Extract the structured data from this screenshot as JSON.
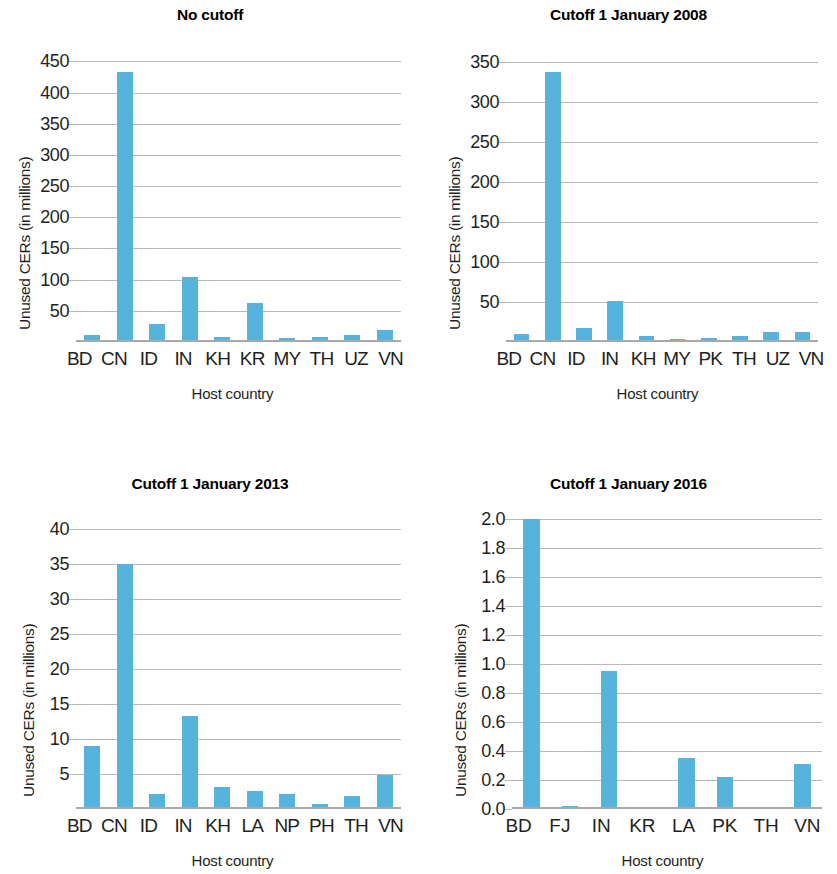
{
  "figure": {
    "panel_count": 4,
    "bar_color": "#55b3de",
    "grid_color": "#b9b9b9",
    "axis_color": "#a8a8a8",
    "text_color": "#231f20"
  },
  "chart_data": [
    {
      "type": "bar",
      "title": "No cutoff",
      "xlabel": "Host country",
      "ylabel": "Unused CERs (in millions)",
      "categories": [
        "BD",
        "CN",
        "ID",
        "IN",
        "KH",
        "KR",
        "MY",
        "TH",
        "UZ",
        "VN"
      ],
      "values": [
        11,
        433,
        29,
        105,
        8,
        63,
        7,
        8,
        12,
        19
      ],
      "yticks": [
        50,
        100,
        150,
        200,
        250,
        300,
        350,
        400,
        450
      ],
      "ylim": [
        0,
        465
      ],
      "grid": true,
      "legend": "none"
    },
    {
      "type": "bar",
      "title": "Cutoff 1 January 2008",
      "xlabel": "Host country",
      "ylabel": "Unused CERs (in millions)",
      "categories": [
        "BD",
        "CN",
        "ID",
        "IN",
        "KH",
        "MY",
        "PK",
        "TH",
        "UZ",
        "VN"
      ],
      "values": [
        10,
        337,
        17,
        51,
        7,
        4,
        5,
        8,
        12,
        12
      ],
      "yticks": [
        50,
        100,
        150,
        200,
        250,
        300,
        350
      ],
      "ylim": [
        0,
        362
      ],
      "grid": true,
      "legend": "none"
    },
    {
      "type": "bar",
      "title": "Cutoff 1 January 2013",
      "xlabel": "Host country",
      "ylabel": "Unused CERs (in millions)",
      "categories": [
        "BD",
        "CN",
        "ID",
        "IN",
        "KH",
        "LA",
        "NP",
        "PH",
        "TH",
        "VN"
      ],
      "values": [
        9.0,
        35.0,
        2.2,
        13.3,
        3.1,
        2.6,
        2.2,
        0.7,
        1.8,
        4.8
      ],
      "yticks": [
        5,
        10,
        15,
        20,
        25,
        30,
        35,
        40
      ],
      "ylim": [
        0,
        41.5
      ],
      "grid": true,
      "legend": "none"
    },
    {
      "type": "bar",
      "title": "Cutoff 1 January 2016",
      "xlabel": "Host country",
      "ylabel": "Unused CERs (in millions)",
      "categories": [
        "BD",
        "FJ",
        "IN",
        "KR",
        "LA",
        "PK",
        "TH",
        "VN"
      ],
      "values": [
        2.0,
        0.02,
        0.95,
        0.005,
        0.35,
        0.22,
        0.0,
        0.31
      ],
      "yticks": [
        0.0,
        0.2,
        0.4,
        0.6,
        0.8,
        1.0,
        1.2,
        1.4,
        1.6,
        1.8,
        2.0
      ],
      "ytick_labels": [
        "0.0",
        "0.2",
        "0.4",
        "0.6",
        "0.8",
        "1.0",
        "1.2",
        "1.4",
        "1.6",
        "1.8",
        "2.0"
      ],
      "ylim": [
        0,
        2.0
      ],
      "grid": true,
      "legend": "none"
    }
  ]
}
